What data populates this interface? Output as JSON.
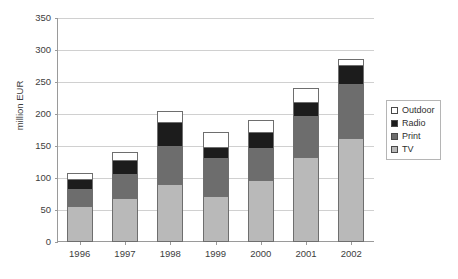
{
  "chart_data": {
    "type": "bar",
    "stacked": true,
    "title": "",
    "xlabel": "",
    "ylabel": "million EUR",
    "categories": [
      "1996",
      "1997",
      "1998",
      "1999",
      "2000",
      "2001",
      "2002"
    ],
    "ylim": [
      0,
      350
    ],
    "yticks": [
      0,
      50,
      100,
      150,
      200,
      250,
      300,
      350
    ],
    "ytick_labels": [
      "0",
      "50",
      "100",
      "150",
      "200",
      "250",
      "300",
      "350"
    ],
    "grid": true,
    "legend_position": "right",
    "series": [
      {
        "name": "TV",
        "color": "#b9b9b9",
        "values": [
          57,
          69,
          90,
          72,
          97,
          133,
          162
        ]
      },
      {
        "name": "Print",
        "color": "#6d6d6d",
        "values": [
          28,
          39,
          62,
          61,
          51,
          65,
          86
        ]
      },
      {
        "name": "Radio",
        "color": "#1c1c1c",
        "values": [
          17,
          24,
          38,
          19,
          27,
          24,
          32
        ]
      },
      {
        "name": "Outdoor",
        "color": "#ffffff",
        "values": [
          10,
          14,
          20,
          25,
          20,
          23,
          10
        ]
      }
    ],
    "cumulative_totals": [
      112,
      146,
      210,
      177,
      195,
      245,
      290
    ]
  },
  "axes": {
    "y_title": "million EUR",
    "y_labels": [
      "350",
      "300",
      "250",
      "200",
      "150",
      "100",
      "50",
      "0"
    ],
    "x_labels": [
      "1996",
      "1997",
      "1998",
      "1999",
      "2000",
      "2001",
      "2002"
    ]
  },
  "legend": {
    "entries": [
      {
        "label": "Outdoor",
        "swatch": "#ffffff"
      },
      {
        "label": "Radio",
        "swatch": "#1c1c1c"
      },
      {
        "label": "Print",
        "swatch": "#6d6d6d"
      },
      {
        "label": "TV",
        "swatch": "#b9b9b9"
      }
    ]
  }
}
